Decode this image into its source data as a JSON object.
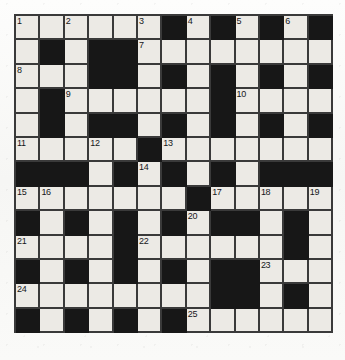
{
  "puzzle": {
    "title": "Crossword Grid",
    "rows": 13,
    "columns": 13,
    "cell_size_px": 24.4,
    "colors": {
      "block": "#171717",
      "open": "#eceae5",
      "grid_line": "#3a3a3a",
      "page_background": "#fbfbfa",
      "number_text": "#15161a"
    },
    "numbers_visible": [
      "1",
      "2",
      "3",
      "4",
      "5",
      "6",
      "7",
      "8",
      "9",
      "10",
      "11",
      "12",
      "13",
      "14",
      "15",
      "16",
      "17",
      "18",
      "19",
      "20",
      "21",
      "22",
      "23",
      "24",
      "25"
    ],
    "letters_filled": false,
    "grid": [
      [
        "W1",
        "W",
        "W2",
        "W",
        "W",
        "W3",
        "B",
        "W4",
        "B",
        "W5",
        "B",
        "W6",
        "B"
      ],
      [
        "W",
        "B",
        "W",
        "B",
        "B",
        "W7",
        "W",
        "W",
        "W",
        "W",
        "W",
        "W",
        "W"
      ],
      [
        "W8",
        "W",
        "W",
        "B",
        "B",
        "W",
        "B",
        "W",
        "B",
        "W",
        "B",
        "W",
        "B"
      ],
      [
        "W",
        "B",
        "W9",
        "W",
        "W",
        "W",
        "W",
        "W",
        "B",
        "W10",
        "W",
        "W",
        "W"
      ],
      [
        "W",
        "B",
        "W",
        "B",
        "B",
        "W",
        "B",
        "W",
        "B",
        "W",
        "B",
        "W",
        "B"
      ],
      [
        "W11",
        "W",
        "W",
        "W12",
        "W",
        "B",
        "W13",
        "W",
        "W",
        "W",
        "W",
        "W",
        "W"
      ],
      [
        "B",
        "B",
        "B",
        "W",
        "B",
        "W14",
        "B",
        "W",
        "B",
        "W",
        "B",
        "B",
        "B"
      ],
      [
        "W15",
        "W16",
        "W",
        "W",
        "W",
        "W",
        "W",
        "B",
        "W17",
        "W",
        "W18",
        "W",
        "W19"
      ],
      [
        "B",
        "W",
        "B",
        "W",
        "B",
        "W",
        "B",
        "W20",
        "B",
        "B",
        "W",
        "B",
        "W"
      ],
      [
        "W21",
        "W",
        "W",
        "W",
        "B",
        "W22",
        "W",
        "W",
        "W",
        "W",
        "W",
        "B",
        "W"
      ],
      [
        "B",
        "W",
        "B",
        "W",
        "B",
        "W",
        "B",
        "W",
        "B",
        "B",
        "W23",
        "W",
        "W"
      ],
      [
        "W24",
        "W",
        "W",
        "W",
        "W",
        "W",
        "W",
        "W",
        "B",
        "B",
        "W",
        "B",
        "W"
      ],
      [
        "B",
        "W",
        "B",
        "W",
        "B",
        "W",
        "B",
        "W25",
        "W",
        "W",
        "W",
        "W",
        "W"
      ]
    ],
    "numbering": {
      "r0c0": "1",
      "r0c2": "2",
      "r0c5": "3",
      "r0c7": "4",
      "r0c9": "5",
      "r0c11": "6",
      "r1c5": "7",
      "r2c0": "8",
      "r3c2": "9",
      "r3c9": "10",
      "r5c0": "11",
      "r5c3": "12",
      "r5c6": "13",
      "r6c5": "14",
      "r7c0": "15",
      "r7c1": "16",
      "r7c8": "17",
      "r7c10": "18",
      "r7c12": "19",
      "r8c7": "20",
      "r9c0": "21",
      "r9c5": "22",
      "r10c10": "23",
      "r11c0": "24",
      "r12c7": "25"
    }
  }
}
